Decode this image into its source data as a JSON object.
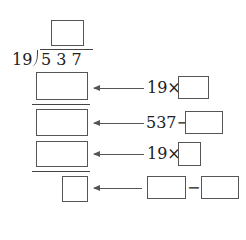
{
  "division": {
    "divisor": "19",
    "dividend": "5 3 7",
    "quotient_box": ""
  },
  "steps": [
    {
      "box": "",
      "hint_prefix": "19×",
      "hint_box": ""
    },
    {
      "box": "",
      "hint_prefix": "537−",
      "hint_box": ""
    },
    {
      "box": "",
      "hint_prefix": "19×",
      "hint_box": ""
    },
    {
      "box": "",
      "hint_box_a": "",
      "hint_op": "−",
      "hint_box_b": ""
    }
  ]
}
